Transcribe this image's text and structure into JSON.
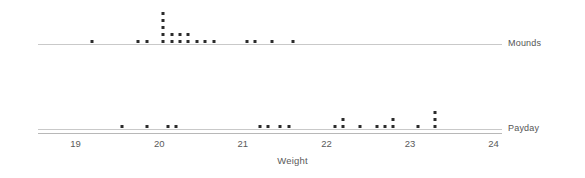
{
  "chart": {
    "title": "",
    "axis_title": "Weight",
    "mounds_label": "Mounds",
    "payday_label": "Payday"
  },
  "chart_data": {
    "type": "scatter",
    "plot_kind": "dotplot",
    "title": "",
    "xlabel": "Weight",
    "ylabel": "",
    "xlim": [
      18.55,
      24.1
    ],
    "xticks": [
      19,
      20,
      21,
      22,
      23,
      24
    ],
    "xticklabels": [
      "19",
      "20",
      "21",
      "22",
      "23",
      "24"
    ],
    "grid": false,
    "legend": "none",
    "dot_color": "#2b2b2b",
    "axis_color": "#b8b8b8",
    "series": [
      {
        "name": "Mounds",
        "row": 0,
        "bins": [
          {
            "x": 19.2,
            "count": 1
          },
          {
            "x": 19.75,
            "count": 1
          },
          {
            "x": 19.85,
            "count": 1
          },
          {
            "x": 20.05,
            "count": 5
          },
          {
            "x": 20.15,
            "count": 2
          },
          {
            "x": 20.25,
            "count": 2
          },
          {
            "x": 20.35,
            "count": 2
          },
          {
            "x": 20.45,
            "count": 1
          },
          {
            "x": 20.55,
            "count": 1
          },
          {
            "x": 20.65,
            "count": 1
          },
          {
            "x": 21.05,
            "count": 1
          },
          {
            "x": 21.15,
            "count": 1
          },
          {
            "x": 21.35,
            "count": 1
          },
          {
            "x": 21.6,
            "count": 1
          }
        ],
        "values": [
          19.2,
          19.75,
          19.85,
          20.05,
          20.05,
          20.05,
          20.05,
          20.05,
          20.15,
          20.15,
          20.25,
          20.25,
          20.35,
          20.35,
          20.45,
          20.55,
          20.65,
          21.05,
          21.15,
          21.35,
          21.6
        ],
        "n": 21
      },
      {
        "name": "Payday",
        "row": 1,
        "bins": [
          {
            "x": 19.55,
            "count": 1
          },
          {
            "x": 19.85,
            "count": 1
          },
          {
            "x": 20.1,
            "count": 1
          },
          {
            "x": 20.2,
            "count": 1
          },
          {
            "x": 21.2,
            "count": 1
          },
          {
            "x": 21.3,
            "count": 1
          },
          {
            "x": 21.45,
            "count": 1
          },
          {
            "x": 21.55,
            "count": 1
          },
          {
            "x": 22.1,
            "count": 1
          },
          {
            "x": 22.2,
            "count": 2
          },
          {
            "x": 22.4,
            "count": 1
          },
          {
            "x": 22.6,
            "count": 1
          },
          {
            "x": 22.7,
            "count": 1
          },
          {
            "x": 22.8,
            "count": 2
          },
          {
            "x": 23.1,
            "count": 1
          },
          {
            "x": 23.3,
            "count": 3
          }
        ],
        "values": [
          19.55,
          19.85,
          20.1,
          20.2,
          21.2,
          21.3,
          21.45,
          21.55,
          22.1,
          22.2,
          22.2,
          22.4,
          22.6,
          22.7,
          22.8,
          22.8,
          23.1,
          23.3,
          23.3,
          23.3
        ],
        "n": 20
      }
    ]
  },
  "layout": {
    "x_left_px": 38,
    "x_right_px": 502,
    "x_min": 18.55,
    "x_max": 24.1,
    "mounds_baseline_y": 44,
    "payday_baseline_y": 129,
    "dot_pitch_y": 7,
    "dot_size_px": 3
  }
}
